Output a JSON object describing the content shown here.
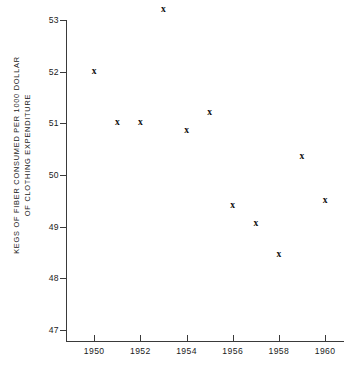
{
  "chart_data": {
    "type": "scatter",
    "title": "",
    "subtitle": "",
    "xlabel": "",
    "ylabel": "KEGS OF FIBER CONSUMED PER 1000 DOLLAR OF CLOTHING EXPENDITURE",
    "ylabel_line1": "KEGS OF FIBER CONSUMED PER 1000 DOLLAR",
    "ylabel_line2": "OF CLOTHING EXPENDITURE",
    "marker": "x",
    "marker_glyph": "×",
    "grid": false,
    "legend": null,
    "legend_position": "none",
    "xlim": [
      1948.7,
      1960.9
    ],
    "ylim": [
      46.4,
      53.4
    ],
    "xticks": [
      1950,
      1952,
      1954,
      1956,
      1958,
      1960
    ],
    "xticklabels": [
      "1950",
      "1952",
      "1954",
      "1956",
      "1958",
      "1960"
    ],
    "yticks": [
      47,
      48,
      49,
      50,
      51,
      52,
      53
    ],
    "yticklabels": [
      "47",
      "48",
      "49",
      "50",
      "51",
      "52",
      "53"
    ],
    "x": [
      1950,
      1951,
      1952,
      1953,
      1954,
      1955,
      1956,
      1957,
      1958,
      1959,
      1960
    ],
    "values": [
      52.0,
      51.0,
      51.0,
      53.2,
      50.85,
      51.2,
      49.4,
      49.05,
      48.45,
      50.35,
      49.5
    ],
    "points": [
      {
        "x": 1950,
        "y": 52.0
      },
      {
        "x": 1951,
        "y": 51.0
      },
      {
        "x": 1952,
        "y": 51.0
      },
      {
        "x": 1953,
        "y": 53.2
      },
      {
        "x": 1954,
        "y": 50.85
      },
      {
        "x": 1955,
        "y": 51.2
      },
      {
        "x": 1956,
        "y": 49.4
      },
      {
        "x": 1957,
        "y": 49.05
      },
      {
        "x": 1958,
        "y": 48.45
      },
      {
        "x": 1959,
        "y": 50.35
      },
      {
        "x": 1960,
        "y": 49.5
      }
    ],
    "colors": {
      "marker": "#111111",
      "axis": "#3a3a3a",
      "text": "#1b1b1b",
      "background": "#ffffff"
    }
  }
}
